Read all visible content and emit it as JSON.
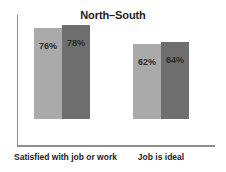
{
  "chart_data": {
    "type": "bar",
    "title": "North–South",
    "xlabel": "",
    "ylabel": "",
    "ylim": [
      0,
      108
    ],
    "grid": false,
    "legend": "none",
    "categories": [
      "Satisfied with job or work",
      "Job is ideal"
    ],
    "series": [
      {
        "name": "North",
        "color": "#aaaaaa",
        "values": [
          76,
          78
        ],
        "labels": [
          "76%",
          "78%"
        ]
      },
      {
        "name": "South",
        "color": "#6e6e6e",
        "values": [
          62,
          64
        ],
        "labels": [
          "62%",
          "64%"
        ]
      }
    ],
    "bars": [
      {
        "group": 0,
        "series": 0,
        "value": 76,
        "label": "76%",
        "color": "#aaaaaa"
      },
      {
        "group": 0,
        "series": 1,
        "value": 78,
        "label": "78%",
        "color": "#6e6e6e"
      },
      {
        "group": 1,
        "series": 0,
        "value": 62,
        "label": "62%",
        "color": "#aaaaaa"
      },
      {
        "group": 1,
        "series": 1,
        "value": 64,
        "label": "64%",
        "color": "#6e6e6e"
      }
    ],
    "axis_color": "#8f8f8f"
  },
  "labels": {
    "title": "North–South",
    "group1": {
      "category": "Satisfied with job or work",
      "bar1_value": "76%",
      "bar2_value": "78%"
    },
    "group2": {
      "category": "Job is ideal",
      "bar1_value": "62%",
      "bar2_value": "64%"
    }
  }
}
